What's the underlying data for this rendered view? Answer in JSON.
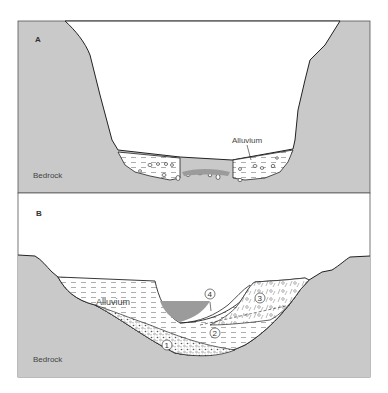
{
  "figure": {
    "panels": [
      {
        "id": "A",
        "label": "A",
        "labels": {
          "bedrock": "Bedrock",
          "alluvium": "Alluvium"
        }
      },
      {
        "id": "B",
        "label": "B",
        "labels": {
          "bedrock": "Bedrock",
          "alluvium": "Alluvium"
        },
        "units": [
          "1",
          "2",
          "3",
          "4"
        ]
      }
    ],
    "colors": {
      "bedrock": "#c9c9c9",
      "water": "#9b9b9b",
      "outline": "#222222",
      "sky": "#ffffff",
      "frame": "#555555"
    }
  }
}
